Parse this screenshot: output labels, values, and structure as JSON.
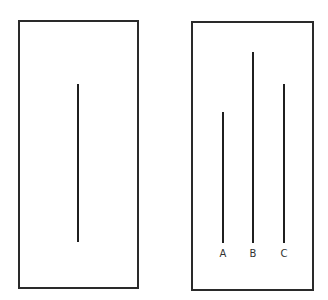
{
  "diagram": {
    "standard_card": {
      "lines": [
        {
          "name": "standard",
          "x": 78,
          "y_top": 84,
          "y_bottom": 242
        }
      ]
    },
    "comparison_card": {
      "lines": [
        {
          "label": "A",
          "x": 223,
          "y_top": 112,
          "y_bottom": 243
        },
        {
          "label": "B",
          "x": 253,
          "y_top": 52,
          "y_bottom": 243
        },
        {
          "label": "C",
          "x": 284,
          "y_top": 84,
          "y_bottom": 243
        }
      ]
    },
    "colors": {
      "stroke": "#1f1f1f",
      "background": "#ffffff"
    }
  }
}
